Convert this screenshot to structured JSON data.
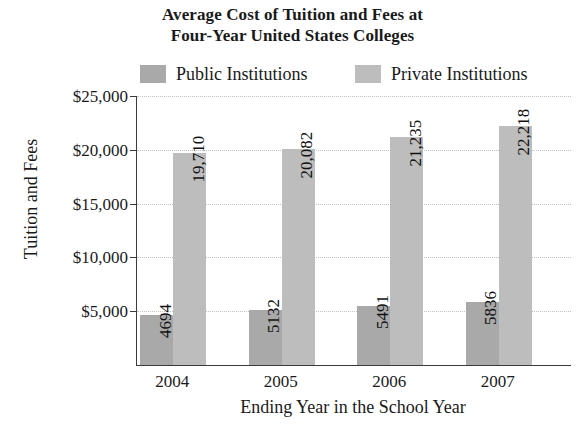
{
  "chart_data": {
    "type": "bar",
    "title": "Average Cost of Tuition and Fees at Four-Year United States Colleges",
    "title_line1": "Average Cost of Tuition and Fees at",
    "title_line2": "Four-Year United States Colleges",
    "xlabel": "Ending Year in the School Year",
    "ylabel": "Tuition and Fees",
    "categories": [
      "2004",
      "2005",
      "2006",
      "2007"
    ],
    "series": [
      {
        "name": "Public Institutions",
        "color": "#a9a9a9",
        "values": [
          4694,
          5132,
          5491,
          5836
        ],
        "labels": [
          "4694",
          "5132",
          "5491",
          "5836"
        ]
      },
      {
        "name": "Private Institutions",
        "color": "#bdbdbd",
        "values": [
          19710,
          20082,
          21235,
          22218
        ],
        "labels": [
          "19,710",
          "20,082",
          "21,235",
          "22,218"
        ]
      }
    ],
    "ylim": [
      0,
      25000
    ],
    "ytick_values": [
      25000,
      20000,
      15000,
      10000,
      5000
    ],
    "ytick_labels": [
      "$25,000",
      "$20,000",
      "$15,000",
      "$10,000",
      "$5,000"
    ],
    "grid": true,
    "legend_position": "top"
  },
  "legend": {
    "items": [
      {
        "label": "Public Institutions",
        "color": "#a9a9a9"
      },
      {
        "label": "Private Institutions",
        "color": "#bdbdbd"
      }
    ]
  }
}
